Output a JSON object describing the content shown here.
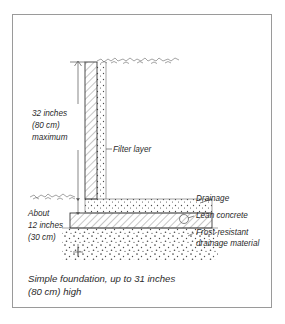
{
  "figure": {
    "frame_color": "#9a9a9a",
    "background": "#ffffff",
    "ink_color": "#2b2b2b",
    "caption_line_1": "Simple foundation, up to 31 inches",
    "caption_line_2": "(80 cm) high"
  },
  "dimensions": {
    "height_line_1": "32 inches",
    "height_line_2": "(80 cm)",
    "height_line_3": "maximum",
    "depth_line_1": "About",
    "depth_line_2": "12 inches",
    "depth_line_3": "(30 cm)"
  },
  "labels": {
    "filter_layer": "Filter layer",
    "drainage": "Drainage",
    "lean_concrete": "Lean concrete",
    "frost_line_1": "Frost-resistant",
    "frost_line_2": "drainage material"
  }
}
